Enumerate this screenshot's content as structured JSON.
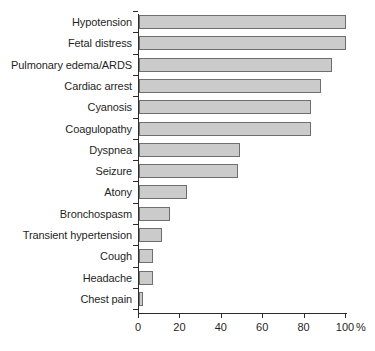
{
  "chart_data": {
    "type": "bar",
    "orientation": "horizontal",
    "title": "",
    "subtitle": "",
    "xlabel": "%",
    "ylabel": "",
    "xlim": [
      0,
      100
    ],
    "ylim": null,
    "grid": false,
    "legend": null,
    "xticks": [
      0,
      20,
      40,
      60,
      80,
      100
    ],
    "xtick_labels": [
      "0",
      "20",
      "40",
      "60",
      "80",
      "100"
    ],
    "x_unit_label": "%",
    "categories": [
      "Hypotension",
      "Fetal distress",
      "Pulmonary edema/ARDS",
      "Cardiac arrest",
      "Cyanosis",
      "Coagulopathy",
      "Dyspnea",
      "Seizure",
      "Atony",
      "Bronchospasm",
      "Transient hypertension",
      "Cough",
      "Headache",
      "Chest pain"
    ],
    "values": [
      100,
      100,
      93,
      88,
      83,
      83,
      49,
      48,
      23,
      15,
      11,
      7,
      7,
      2
    ],
    "series": [
      {
        "name": "Frequency",
        "values": [
          100,
          100,
          93,
          88,
          83,
          83,
          49,
          48,
          23,
          15,
          11,
          7,
          7,
          2
        ]
      }
    ],
    "colors": {
      "bar_fill": "#cbcbcb",
      "bar_edge": "#6e6e6e",
      "axis": "#2b2b2b",
      "text": "#1f1f1f",
      "background": "#ffffff"
    }
  }
}
